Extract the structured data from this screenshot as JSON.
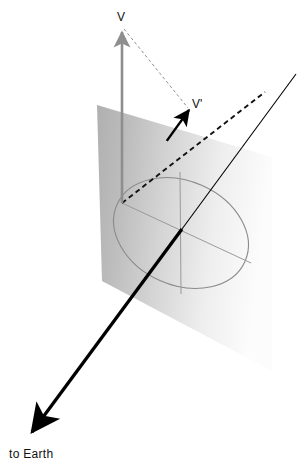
{
  "figure": {
    "kind": "vector-projection-onto-plane",
    "background_color": "#ffffff",
    "width": 299,
    "height": 467
  },
  "labels": {
    "v": "V",
    "v_prime": "V'",
    "to_earth": "to Earth"
  },
  "colors": {
    "plane_dark": "#b2b2b2",
    "plane_light": "#fdfdfd",
    "ellipse_stroke": "#8a8a8a",
    "axis_stroke": "#9a9a9a",
    "vector_v_stroke": "#8e8e8e",
    "vector_vprime_stroke": "#000000",
    "dashed_connector": "#8e8e8e",
    "dashdot_stroke": "#111111",
    "line_of_sight": "#000000",
    "label_color": "#111111"
  },
  "geometry": {
    "plane_polygon": "97,105 272,157 272,371 102,281",
    "ellipse": {
      "center_x": 181,
      "center_y": 233,
      "radius_x": 70,
      "radius_y": 52,
      "rotation_deg": 24
    },
    "axis_minor": {
      "x1": 122,
      "y1": 203,
      "x2": 251,
      "y2": 263
    },
    "axis_major": {
      "x1": 180,
      "y1": 172,
      "x2": 181,
      "y2": 294
    },
    "vector_v": {
      "x1": 122,
      "y1": 203,
      "x2": 122,
      "y2": 30
    },
    "vector_vprime": {
      "x1": 122,
      "y1": 203,
      "x2": 189,
      "y2": 110
    },
    "dashed_connector": {
      "x1": 124,
      "y1": 29,
      "x2": 188,
      "y2": 108
    },
    "dashdot_line": {
      "x1": 122,
      "y1": 203,
      "x2": 265,
      "y2": 92
    },
    "line_of_sight": {
      "x1": 296,
      "y1": 74,
      "x2": 27,
      "y2": 438
    }
  },
  "label_positions": {
    "v": {
      "x": 117,
      "y": 21
    },
    "v_prime": {
      "x": 192,
      "y": 108
    },
    "to_earth": {
      "x": 9,
      "y": 458
    }
  }
}
